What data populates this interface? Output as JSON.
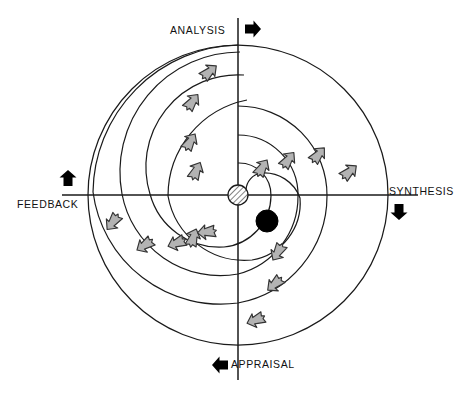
{
  "diagram": {
    "type": "spiral-cycle-quadrant-diagram",
    "colors": {
      "line": "#1a1a1a",
      "arrow_fill": "#b3b3b3",
      "arrow_stroke": "#333333",
      "marker_fill": "#000000",
      "origin_hatch": "#888888",
      "background": "#ffffff"
    },
    "axes": {
      "center": {
        "x": 238,
        "y": 195
      },
      "outer_radius": 150,
      "vertical_extent": {
        "top": 18,
        "bottom": 380
      },
      "horizontal_extent": {
        "left": 62,
        "bottom": 418
      }
    },
    "quadrant_labels": [
      {
        "id": "analysis",
        "text": "ANALYSIS",
        "position": "top",
        "marker_icon": "arrow-right-icon",
        "marker_direction": "right"
      },
      {
        "id": "synthesis",
        "text": "SYNTHESIS",
        "position": "right",
        "marker_icon": "arrow-down-icon",
        "marker_direction": "down"
      },
      {
        "id": "appraisal",
        "text": "APPRAISAL",
        "position": "bottom",
        "marker_icon": "arrow-left-icon",
        "marker_direction": "left"
      },
      {
        "id": "feedback",
        "text": "FEEDBACK",
        "position": "left",
        "marker_icon": "arrow-up-icon",
        "marker_direction": "up"
      }
    ],
    "origin_marker": {
      "id": "origin",
      "shape": "hatched-circle",
      "radius": 10
    },
    "state_marker": {
      "id": "current-state",
      "shape": "filled-circle",
      "radius": 11,
      "quadrant": "synthesis",
      "position": {
        "x": 267,
        "y": 221
      }
    },
    "spiral_arms": [
      {
        "id": "arm-1",
        "turn": 1,
        "flow_arrows": 4
      },
      {
        "id": "arm-2",
        "turn": 2,
        "flow_arrows": 4
      },
      {
        "id": "arm-3",
        "turn": 3,
        "flow_arrows": 4
      },
      {
        "id": "arm-4",
        "turn": 4,
        "flow_arrows": 3
      }
    ],
    "flow_arrow_count": 15,
    "rotation_direction": "clockwise"
  }
}
